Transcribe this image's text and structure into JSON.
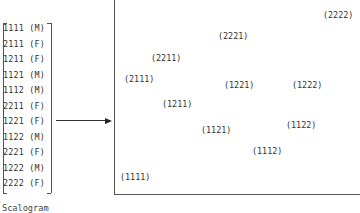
{
  "scalogram": {
    "caption": "Scalogram",
    "rows": [
      "1111 (M)",
      "2111 (F)",
      "1211 (F)",
      "1121 (M)",
      "1112 (M)",
      "2211 (F)",
      "1221 (F)",
      "1122 (M)",
      "2221 (F)",
      "1222 (M)",
      "2222 (F)"
    ]
  },
  "arrow": {
    "direction": "right"
  },
  "plot": {
    "points": [
      {
        "label": "(2222)",
        "x": 323,
        "y": 16
      },
      {
        "label": "(2221)",
        "x": 218,
        "y": 37
      },
      {
        "label": "(2211)",
        "x": 151,
        "y": 59
      },
      {
        "label": "(2111)",
        "x": 124,
        "y": 80
      },
      {
        "label": "(1221)",
        "x": 224,
        "y": 86
      },
      {
        "label": "(1222)",
        "x": 292,
        "y": 86
      },
      {
        "label": "(1211)",
        "x": 162,
        "y": 105
      },
      {
        "label": "(1122)",
        "x": 286,
        "y": 126
      },
      {
        "label": "(1121)",
        "x": 201,
        "y": 131
      },
      {
        "label": "(1112)",
        "x": 252,
        "y": 152
      },
      {
        "label": "(1111)",
        "x": 120,
        "y": 178
      }
    ]
  }
}
